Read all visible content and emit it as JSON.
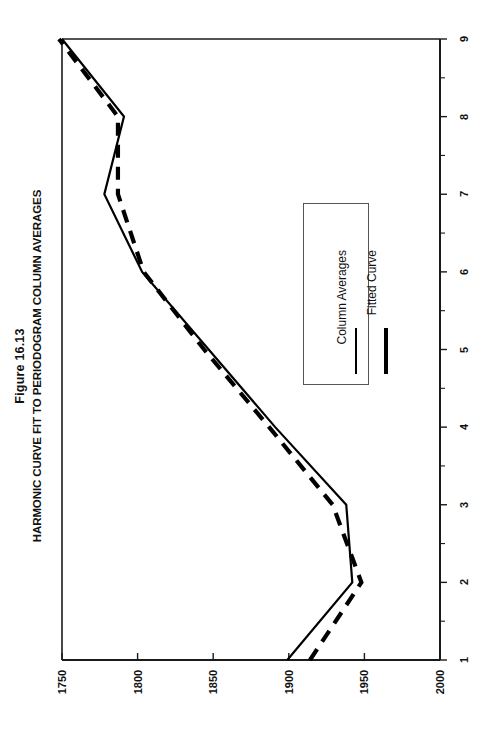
{
  "figure": {
    "title_line1": "Figure 16.13",
    "title_line2": "HARMONIC CURVE FIT TO PERIODOGRAM COLUMN AVERAGES"
  },
  "legend": {
    "entries": [
      {
        "label": "Column Averages",
        "style": "solid",
        "color": "#000000"
      },
      {
        "label": "Fitted Curve",
        "style": "dashed",
        "color": "#000000"
      }
    ]
  },
  "axes": {
    "value_axis_ticks": [
      "2000",
      "1950",
      "1900",
      "1850",
      "1800",
      "1750"
    ],
    "category_axis_ticks": [
      "1",
      "2",
      "3",
      "4",
      "5",
      "6",
      "7",
      "8",
      "9"
    ]
  },
  "chart_data": {
    "type": "line",
    "title": "HARMONIC CURVE FIT TO PERIODOGRAM COLUMN AVERAGES",
    "subtitle": "Figure 16.13",
    "orientation": "rotated-90-ccw",
    "xlabel": "",
    "ylabel": "",
    "x": [
      1,
      2,
      3,
      4,
      5,
      6,
      7,
      8,
      9
    ],
    "xlim": [
      1,
      9
    ],
    "ylim": [
      1750,
      2000
    ],
    "yticks": [
      1750,
      1800,
      1850,
      1900,
      1950,
      2000
    ],
    "xticks": [
      1,
      2,
      3,
      4,
      5,
      6,
      7,
      8,
      9
    ],
    "grid": false,
    "legend_position": "inside-center-right",
    "series": [
      {
        "name": "Column Averages",
        "style": "solid",
        "color": "#000000",
        "values": [
          1851,
          1808,
          1812,
          1859,
          1903,
          1947,
          1972,
          1959,
          2000
        ]
      },
      {
        "name": "Fitted Curve",
        "style": "dashed",
        "color": "#000000",
        "values": [
          1836,
          1802,
          1821,
          1863,
          1906,
          1946,
          1963,
          1963,
          2002
        ]
      }
    ]
  },
  "geometry": {
    "plot_left_px": 62,
    "plot_right_px": 440,
    "plot_top_px": 39,
    "plot_bottom_px": 660
  }
}
